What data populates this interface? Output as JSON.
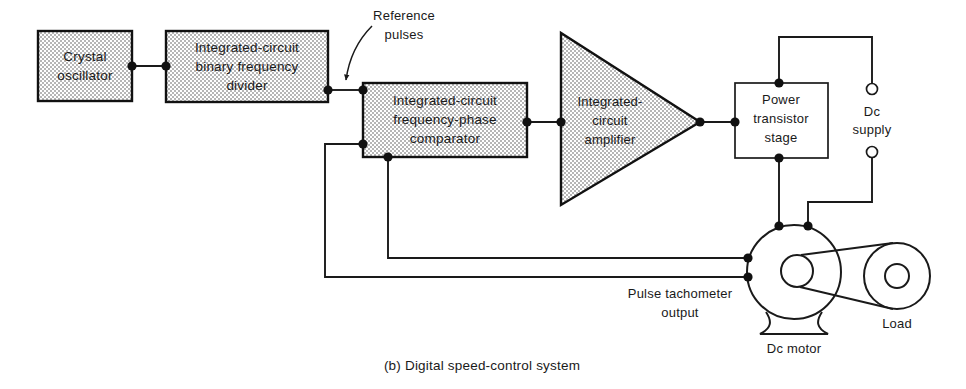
{
  "figure": {
    "caption": "(b) Digital speed-control system",
    "annotations": {
      "reference_pulses_line1": "Reference",
      "reference_pulses_line2": "pulses",
      "tach_line1": "Pulse tachometer",
      "tach_line2": "output"
    },
    "blocks": [
      {
        "id": "crystal-oscillator",
        "lines": [
          "Crystal",
          "oscillator"
        ],
        "shape": "rect-stippled"
      },
      {
        "id": "binary-frequency-divider",
        "lines": [
          "Integrated-circuit",
          "binary  frequency",
          "divider"
        ],
        "shape": "rect-stippled"
      },
      {
        "id": "frequency-phase-comparator",
        "lines": [
          "Integrated-circuit",
          "frequency-phase",
          "comparator"
        ],
        "shape": "rect-stippled"
      },
      {
        "id": "ic-amplifier",
        "lines": [
          "Integrated-",
          "circuit",
          "amplifier"
        ],
        "shape": "triangle-stippled"
      },
      {
        "id": "power-transistor-stage",
        "lines": [
          "Power",
          "transistor",
          "stage"
        ],
        "shape": "rect-plain"
      }
    ],
    "components": [
      {
        "id": "dc-supply",
        "lines": [
          "Dc",
          "supply"
        ],
        "shape": "terminal-pair"
      },
      {
        "id": "dc-motor",
        "lines": [
          "Dc  motor"
        ],
        "shape": "motor"
      },
      {
        "id": "load",
        "lines": [
          "Load"
        ],
        "shape": "pulley"
      }
    ],
    "colors": {
      "ink": "#1a1a1a",
      "fill_stipple": "#f2f2f2",
      "background": "#ffffff"
    }
  }
}
